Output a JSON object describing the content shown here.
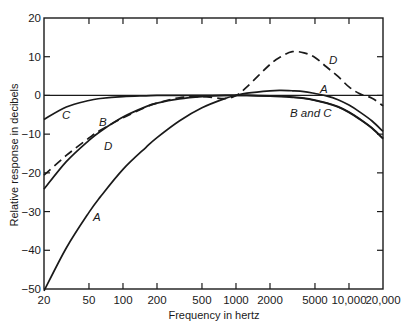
{
  "chart_data": {
    "type": "line",
    "title": "",
    "xlabel": "Frequency in hertz",
    "ylabel": "Relative response in decibels",
    "xscale": "log",
    "xlim": [
      20,
      20000
    ],
    "ylim": [
      -50,
      20
    ],
    "grid": false,
    "legend": "none (curves labeled inline)",
    "x_ticks": [
      20,
      50,
      100,
      200,
      500,
      1000,
      2000,
      5000,
      10000,
      20000
    ],
    "x_tick_labels": [
      "20",
      "50",
      "100",
      "200",
      "500",
      "1000",
      "2000",
      "5000",
      "10,000",
      "20,000"
    ],
    "y_ticks": [
      20,
      10,
      0,
      -10,
      -20,
      -30,
      -40,
      -50
    ],
    "y_tick_labels": [
      "20",
      "10",
      "0",
      "−10",
      "−20",
      "−30",
      "−40",
      "−50"
    ],
    "reference_line_y": 0,
    "x": [
      20,
      31.5,
      50,
      63,
      100,
      160,
      200,
      315,
      500,
      800,
      1000,
      1250,
      2000,
      2500,
      3150,
      4000,
      5000,
      6300,
      8000,
      10000,
      12500,
      16000,
      20000
    ],
    "series": [
      {
        "name": "A",
        "style": "solid",
        "values": [
          -50.5,
          -39.4,
          -30.2,
          -26.2,
          -19.1,
          -13.4,
          -10.9,
          -6.6,
          -3.2,
          -0.8,
          0,
          0.6,
          1.2,
          1.3,
          1.2,
          1.0,
          0.5,
          -0.1,
          -1.1,
          -2.5,
          -4.3,
          -6.6,
          -9.3
        ]
      },
      {
        "name": "B",
        "style": "solid",
        "values": [
          -24.2,
          -17.1,
          -11.6,
          -9.3,
          -5.6,
          -2.9,
          -2.0,
          -0.9,
          -0.3,
          0,
          0,
          0,
          -0.1,
          -0.2,
          -0.4,
          -0.7,
          -1.2,
          -1.9,
          -2.9,
          -4.3,
          -6.1,
          -8.4,
          -11.1
        ]
      },
      {
        "name": "C",
        "style": "solid",
        "values": [
          -6.2,
          -3.0,
          -1.3,
          -0.8,
          -0.3,
          -0.1,
          0,
          0,
          0,
          0,
          0,
          0,
          -0.2,
          -0.3,
          -0.5,
          -0.8,
          -1.3,
          -2.0,
          -3.0,
          -4.4,
          -6.2,
          -8.5,
          -11.2
        ]
      },
      {
        "name": "D",
        "style": "dashed",
        "values": [
          -20.6,
          -15.5,
          -11.0,
          -9.0,
          -5.8,
          -3.0,
          -2.0,
          -0.6,
          -0.3,
          -0.8,
          0,
          2.2,
          8.0,
          10.0,
          11.3,
          11.0,
          9.8,
          7.4,
          4.9,
          2.2,
          0.4,
          -0.7,
          -2.7
        ]
      }
    ],
    "annotations": [
      {
        "text": "A",
        "near_hz": 55,
        "near_db": -31
      },
      {
        "text": "A",
        "near_hz": 5500,
        "near_db": 1.6
      },
      {
        "text": "B",
        "near_hz": 55,
        "near_db": -7
      },
      {
        "text": "C",
        "near_hz": 27,
        "near_db": -5
      },
      {
        "text": "D",
        "near_hz": 60,
        "near_db": -13
      },
      {
        "text": "D",
        "near_hz": 7000,
        "near_db": 9
      },
      {
        "text": "B and C",
        "near_hz": 3500,
        "near_db": -4.5
      }
    ]
  },
  "labels": {
    "curve_A_low": "A",
    "curve_A_high": "A",
    "curve_B": "B",
    "curve_C": "C",
    "curve_D_low": "D",
    "curve_D_high": "D",
    "curve_BC": "B and C"
  }
}
